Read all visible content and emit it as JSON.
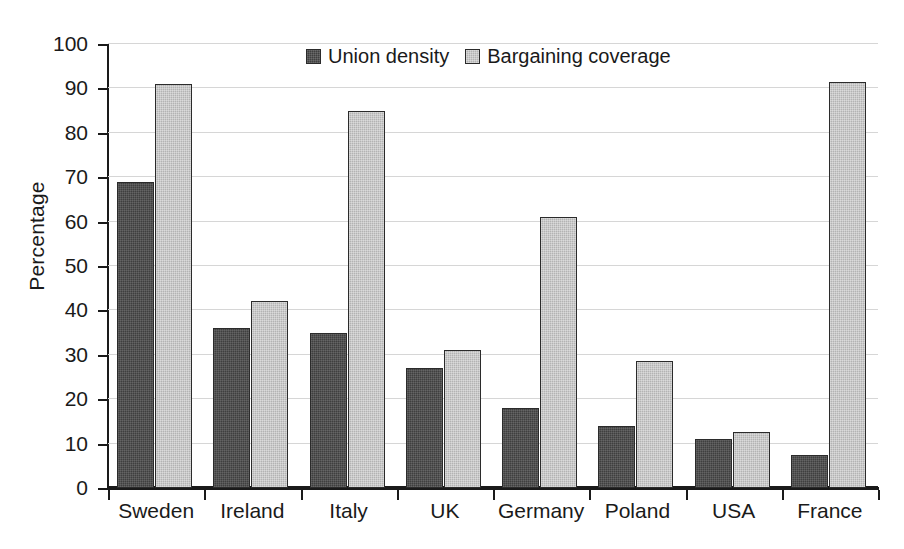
{
  "chart_data": {
    "type": "bar",
    "title": "",
    "xlabel": "",
    "ylabel": "Percentage",
    "ylim": [
      0,
      100
    ],
    "ytick_step": 10,
    "yticks": [
      0,
      10,
      20,
      30,
      40,
      50,
      60,
      70,
      80,
      90,
      100
    ],
    "ytick_labels": [
      "0",
      "10",
      "20",
      "30",
      "40",
      "50",
      "60",
      "70",
      "80",
      "90",
      "100"
    ],
    "grid": "horizontal",
    "legend_position": "top-center",
    "categories": [
      "Sweden",
      "Ireland",
      "Italy",
      "UK",
      "Germany",
      "Poland",
      "USA",
      "France"
    ],
    "series": [
      {
        "name": "Union density",
        "color": "#3f3f3f",
        "values": [
          69,
          36,
          35,
          27,
          18,
          14,
          11,
          7.5
        ]
      },
      {
        "name": "Bargaining coverage",
        "color": "#b3b3b3",
        "values": [
          91,
          42.2,
          85,
          31.1,
          61,
          28.7,
          12.7,
          91.5
        ]
      }
    ]
  }
}
